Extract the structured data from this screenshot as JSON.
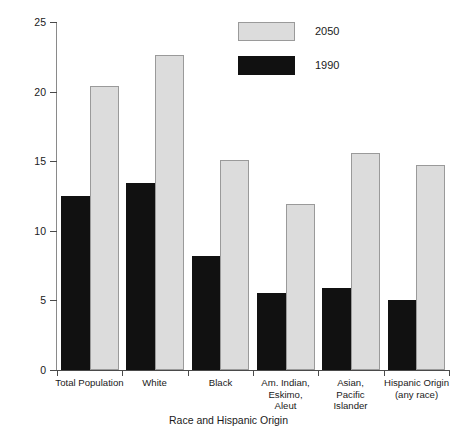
{
  "chart_data": {
    "type": "bar",
    "title": "",
    "xlabel": "Race and Hispanic Origin",
    "ylabel": "Percent",
    "ylim": [
      0,
      25
    ],
    "yticks": [
      0,
      5,
      10,
      15,
      20,
      25
    ],
    "ytick_labels": [
      "0",
      "5",
      "10",
      "15",
      "20",
      "25"
    ],
    "grid": false,
    "legend_position": "top-center",
    "categories": [
      "Total Population",
      "White",
      "Black",
      "Am. Indian, Eskimo, Aleut",
      "Asian, Pacific Islander",
      "Hispanic Origin (any race)"
    ],
    "category_label_lines": [
      [
        "Total Population"
      ],
      [
        "White"
      ],
      [
        "Black"
      ],
      [
        "Am. Indian,",
        "Eskimo,",
        "Aleut"
      ],
      [
        "Asian,",
        "Pacific",
        "Islander"
      ],
      [
        "Hispanic Origin",
        "(any race)"
      ]
    ],
    "series": [
      {
        "name": "1990",
        "color": "#111111",
        "values": [
          12.5,
          13.4,
          8.2,
          5.5,
          5.9,
          5.0
        ]
      },
      {
        "name": "2050",
        "color": "#dcdcdc",
        "values": [
          20.4,
          22.6,
          15.1,
          11.9,
          15.6,
          14.7
        ]
      }
    ]
  },
  "legend": {
    "entries": [
      {
        "label": "2050",
        "swatch": "light-gray-filled-rect"
      },
      {
        "label": "1990",
        "swatch": "black-filled-rect"
      }
    ]
  },
  "axes": {
    "y_title": "Percent",
    "x_title": "Race and Hispanic Origin"
  }
}
